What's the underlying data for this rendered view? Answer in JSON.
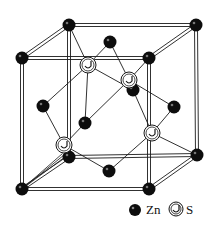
{
  "colors": {
    "zn_fill": "#0d0d0d",
    "s_fill": "#ffffff",
    "line": "#1a1a1a",
    "background": "#ffffff"
  },
  "legend": {
    "zn_label": "Zn",
    "s_label": "S"
  },
  "atoms": {
    "zn_corners": [
      {
        "id": "corner-back-top-left"
      },
      {
        "id": "corner-back-top-right"
      },
      {
        "id": "corner-front-top-left"
      },
      {
        "id": "corner-front-top-right"
      },
      {
        "id": "corner-back-bottom-left"
      },
      {
        "id": "corner-back-bottom-right"
      },
      {
        "id": "corner-front-bottom-left"
      },
      {
        "id": "corner-front-bottom-right"
      }
    ],
    "zn_faces": [
      {
        "id": "face-top"
      },
      {
        "id": "face-bottom"
      },
      {
        "id": "face-left"
      },
      {
        "id": "face-right"
      },
      {
        "id": "face-front"
      },
      {
        "id": "face-back"
      }
    ],
    "s_tetrahedral": [
      {
        "id": "s-1"
      },
      {
        "id": "s-2"
      },
      {
        "id": "s-3"
      },
      {
        "id": "s-4"
      }
    ]
  }
}
